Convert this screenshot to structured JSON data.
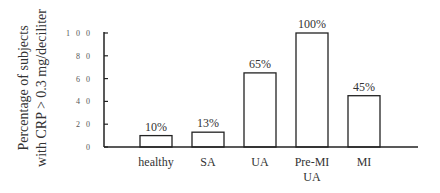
{
  "chart_data": {
    "type": "bar",
    "title": "",
    "xlabel": "",
    "ylabel_lines": [
      "Percentage of subjects",
      "with CRP > 0.3 mg/deciliter"
    ],
    "ylabel": "Percentage of subjects with CRP > 0.3 mg/deciliter",
    "ylim": [
      0,
      100
    ],
    "yticks": [
      0,
      20,
      40,
      60,
      80,
      100
    ],
    "ytick_labels": [
      "0",
      "2 0",
      "4 0",
      "6 0",
      "8 0",
      "1 0 0"
    ],
    "categories": [
      "healthy",
      "SA",
      "UA",
      "Pre-MI UA",
      "MI"
    ],
    "category_label_lines": [
      [
        "healthy"
      ],
      [
        "SA"
      ],
      [
        "UA"
      ],
      [
        "Pre-MI",
        "UA"
      ],
      [
        "MI"
      ]
    ],
    "values": [
      10,
      13,
      65,
      100,
      45
    ],
    "value_labels": [
      "10%",
      "13%",
      "65%",
      "100%",
      "45%"
    ],
    "grid": false,
    "legend": null,
    "bar_fill": "#ffffff",
    "bar_stroke": "#222222"
  }
}
